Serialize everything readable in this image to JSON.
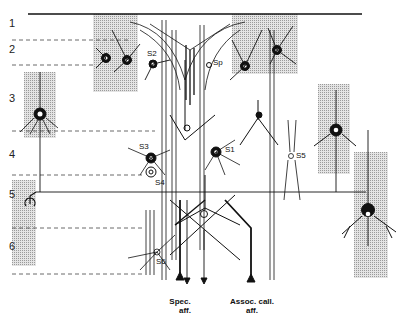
{
  "diagram": {
    "type": "neuroanatomy-cortical-layers",
    "layers": [
      {
        "id": "1",
        "label": "1"
      },
      {
        "id": "2",
        "label": "2"
      },
      {
        "id": "3",
        "label": "3"
      },
      {
        "id": "4",
        "label": "4"
      },
      {
        "id": "5",
        "label": "5"
      },
      {
        "id": "6",
        "label": "6"
      }
    ],
    "cell_labels": {
      "s1": "S1",
      "s2": "S2",
      "s3": "S3",
      "s4": "S4",
      "s5": "S5",
      "s6": "S6",
      "sp": "Sp"
    },
    "afferents": {
      "specific": {
        "line1": "Spec.",
        "line2": "aff."
      },
      "associative": {
        "line1": "Assoc. call.",
        "line2": "aff."
      }
    },
    "colors": {
      "ink": "#111111",
      "shading": "#c8c8c8",
      "dashed": "#444444"
    }
  }
}
